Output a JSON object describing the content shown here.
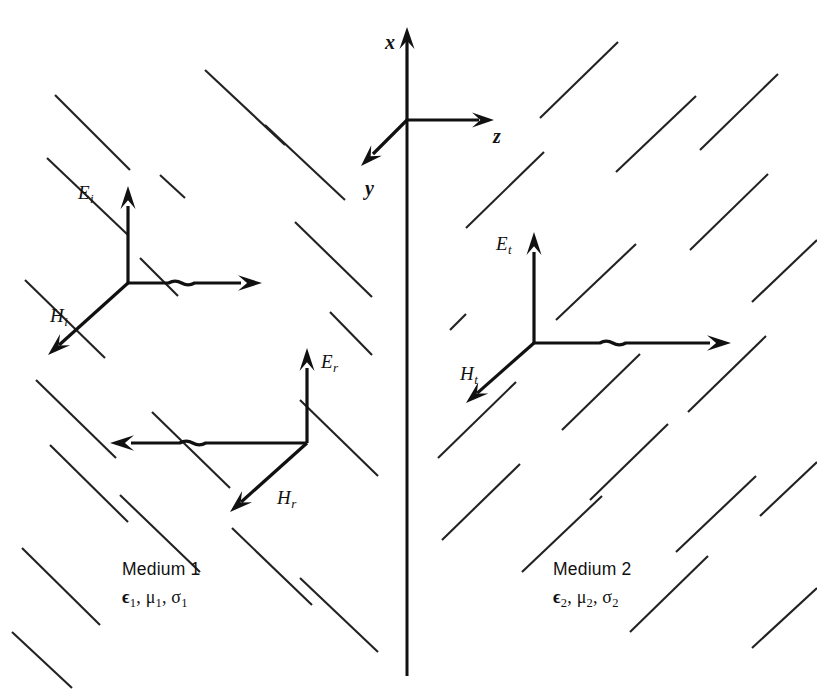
{
  "figure": {
    "background_color": "#ffffff",
    "line_color": "#111111",
    "width": 817,
    "height": 690
  },
  "axes": {
    "origin": {
      "x": 407,
      "y": 120
    },
    "items": [
      {
        "name": "x",
        "label": "x",
        "direction": "up",
        "label_x": 385,
        "label_y": 32
      },
      {
        "name": "z",
        "label": "z",
        "direction": "right",
        "label_x": 493,
        "label_y": 126
      },
      {
        "name": "y",
        "label": "y",
        "direction": "down-left",
        "label_x": 365,
        "label_y": 178
      }
    ]
  },
  "interface": {
    "name": "boundary-line",
    "x": 407,
    "y_top": 120,
    "y_bottom": 676
  },
  "waves": [
    {
      "id": "incident",
      "name": "incident-wave",
      "origin": {
        "x": 128,
        "y": 283
      },
      "e_field": {
        "label": "E",
        "subscript": "i",
        "direction": "up",
        "tip_y": 186,
        "label_x": 78,
        "label_y": 183
      },
      "h_field": {
        "label": "H",
        "subscript": "i",
        "direction": "down-left",
        "tip_x": 48,
        "tip_y": 355,
        "label_x": 50,
        "label_y": 306
      },
      "propagation": {
        "direction": "right",
        "tip_x": 262,
        "tip_y": 283,
        "has_crossover": true
      }
    },
    {
      "id": "reflected",
      "name": "reflected-wave",
      "origin": {
        "x": 307,
        "y": 443
      },
      "e_field": {
        "label": "E",
        "subscript": "r",
        "direction": "up",
        "tip_y": 348,
        "label_x": 321,
        "label_y": 352
      },
      "h_field": {
        "label": "H",
        "subscript": "r",
        "direction": "down-left",
        "tip_x": 230,
        "tip_y": 512,
        "label_x": 277,
        "label_y": 488
      },
      "propagation": {
        "direction": "left",
        "tip_x": 110,
        "tip_y": 443,
        "has_crossover": true
      }
    },
    {
      "id": "transmitted",
      "name": "transmitted-wave",
      "origin": {
        "x": 534,
        "y": 343
      },
      "e_field": {
        "label": "E",
        "subscript": "t",
        "direction": "up",
        "tip_y": 232,
        "label_x": 496,
        "label_y": 234
      },
      "h_field": {
        "label": "H",
        "subscript": "t",
        "direction": "down-left",
        "tip_x": 466,
        "tip_y": 403,
        "label_x": 460,
        "label_y": 364
      },
      "propagation": {
        "direction": "right",
        "tip_x": 731,
        "tip_y": 343,
        "has_crossover": true
      }
    }
  ],
  "media": [
    {
      "id": "medium1",
      "name": "Medium 1",
      "params": "ϵ₁, μ₁, σ₁",
      "permittivity": "ϵ",
      "permeability": "μ",
      "conductivity": "σ",
      "index": "1",
      "label_x": 122,
      "label_y": 558,
      "hatch_slant": "backslash"
    },
    {
      "id": "medium2",
      "name": "Medium 2",
      "params": "ϵ₂, μ₂, σ₂",
      "permittivity": "ϵ",
      "permeability": "μ",
      "conductivity": "σ",
      "index": "2",
      "label_x": 553,
      "label_y": 558,
      "hatch_slant": "forwardslash"
    }
  ],
  "hatching": {
    "left": [
      [
        55,
        95,
        130,
        170
      ],
      [
        205,
        70,
        285,
        145
      ],
      [
        265,
        125,
        345,
        200
      ],
      [
        47,
        158,
        128,
        235
      ],
      [
        160,
        175,
        185,
        198
      ],
      [
        25,
        280,
        105,
        358
      ],
      [
        140,
        258,
        178,
        296
      ],
      [
        295,
        222,
        372,
        297
      ],
      [
        36,
        380,
        116,
        458
      ],
      [
        330,
        312,
        372,
        355
      ],
      [
        50,
        445,
        128,
        522
      ],
      [
        152,
        412,
        230,
        488
      ],
      [
        300,
        400,
        378,
        476
      ],
      [
        22,
        548,
        100,
        625
      ],
      [
        120,
        495,
        200,
        572
      ],
      [
        232,
        528,
        312,
        605
      ],
      [
        300,
        578,
        378,
        652
      ],
      [
        12,
        632,
        72,
        688
      ]
    ],
    "right": [
      [
        540,
        118,
        618,
        42
      ],
      [
        616,
        172,
        696,
        96
      ],
      [
        700,
        150,
        778,
        74
      ],
      [
        466,
        228,
        544,
        152
      ],
      [
        690,
        250,
        768,
        174
      ],
      [
        450,
        330,
        466,
        314
      ],
      [
        556,
        320,
        636,
        244
      ],
      [
        752,
        302,
        817,
        240
      ],
      [
        438,
        458,
        516,
        382
      ],
      [
        562,
        430,
        640,
        354
      ],
      [
        688,
        412,
        766,
        336
      ],
      [
        442,
        540,
        520,
        464
      ],
      [
        522,
        572,
        602,
        496
      ],
      [
        590,
        500,
        668,
        424
      ],
      [
        676,
        552,
        756,
        476
      ],
      [
        760,
        516,
        817,
        462
      ],
      [
        630,
        632,
        708,
        556
      ],
      [
        752,
        648,
        817,
        588
      ]
    ]
  }
}
